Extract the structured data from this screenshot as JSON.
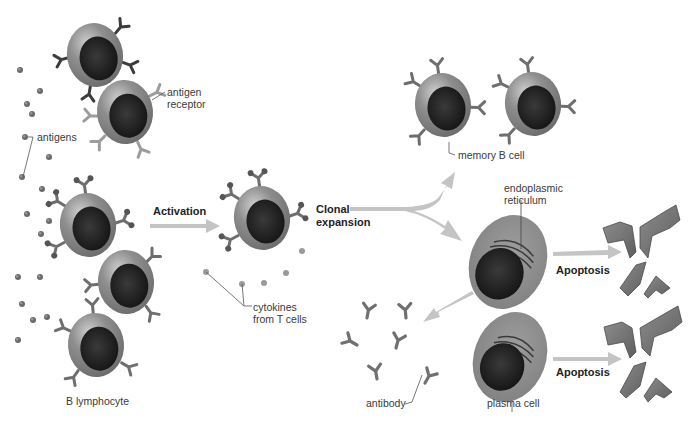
{
  "diagram": {
    "colors": {
      "background": "#ffffff",
      "cell_body": "#8a8a8a",
      "cell_nucleus": "#1e1e1e",
      "receptor_dark": "#3a3a3a",
      "receptor_light": "#9a9a9a",
      "arrow": "#c4c4c4",
      "antigen": "#6a6a6a",
      "label_text": "#3a3a3a"
    },
    "labels": {
      "antigen_receptor_line1": "antigen",
      "antigen_receptor_line2": "receptor",
      "antigens": "antigens",
      "b_lymphocyte": "B lymphocyte",
      "activation": "Activation",
      "cytokines_line1": "cytokines",
      "cytokines_line2": "from T cells",
      "clonal_line1": "Clonal",
      "clonal_line2": "expansion",
      "memory_b_cell": "memory B cell",
      "er_line1": "endoplasmic",
      "er_line2": "reticulum",
      "apoptosis_top": "Apoptosis",
      "apoptosis_bottom": "Apoptosis",
      "antibody": "antibody",
      "plasma_cell": "plasma cell"
    },
    "stages": [
      {
        "name": "naive B lymphocytes",
        "cell_count": 5
      },
      {
        "name": "activated B cell",
        "cell_count": 1
      },
      {
        "name": "memory B cells",
        "cell_count": 2
      },
      {
        "name": "plasma cells",
        "cell_count": 2
      },
      {
        "name": "apoptotic fragments",
        "fragment_count": 8
      },
      {
        "name": "antibodies",
        "count": 6
      }
    ]
  }
}
